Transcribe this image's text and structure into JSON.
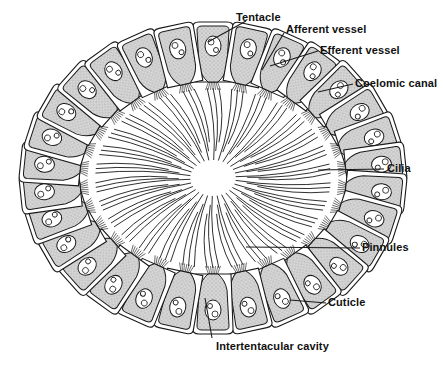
{
  "diagram": {
    "center": {
      "x": 213,
      "y": 178
    },
    "ellipse": {
      "rx": 190,
      "ry": 150
    },
    "cell_count": 30,
    "colors": {
      "stroke": "#1a1a1a",
      "cell_fill": "#cfcfcf",
      "background": "#ffffff"
    },
    "labels": [
      {
        "id": "tentacle",
        "text": "Tentacle",
        "x": 236,
        "y": 11,
        "line": [
          [
            246,
            21
          ],
          [
            208,
            42
          ]
        ]
      },
      {
        "id": "afferent",
        "text": "Afferent vessel",
        "x": 286,
        "y": 23,
        "line": [
          [
            284,
            33
          ],
          [
            262,
            70
          ]
        ]
      },
      {
        "id": "efferent",
        "text": "Efferent vessel",
        "x": 320,
        "y": 44,
        "line": [
          [
            318,
            51
          ],
          [
            270,
            66
          ]
        ]
      },
      {
        "id": "coelomic",
        "text": "Coelomic canal",
        "x": 355,
        "y": 77,
        "line": [
          [
            353,
            84
          ],
          [
            318,
            92
          ]
        ]
      },
      {
        "id": "cilia",
        "text": "Cilia",
        "x": 387,
        "y": 162,
        "line": [
          [
            384,
            169
          ],
          [
            318,
            170
          ]
        ]
      },
      {
        "id": "pinnules",
        "text": "Pinnules",
        "x": 362,
        "y": 241,
        "line": [
          [
            360,
            248
          ],
          [
            246,
            247
          ]
        ]
      },
      {
        "id": "cuticle",
        "text": "Cuticle",
        "x": 328,
        "y": 296,
        "line": [
          [
            326,
            303
          ],
          [
            290,
            300
          ]
        ]
      },
      {
        "id": "intertentacular",
        "text": "Intertentacular cavity",
        "x": 216,
        "y": 340,
        "line": [
          [
            212,
            338
          ],
          [
            205,
            298
          ]
        ]
      }
    ]
  }
}
